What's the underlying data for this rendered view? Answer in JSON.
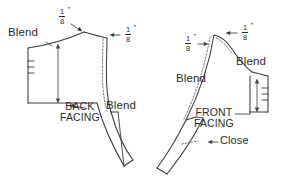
{
  "diagram": {
    "type": "sewing-pattern-adjustment",
    "background_color": "#ffffff",
    "ink_color": "#2b2b2b",
    "pieces": [
      {
        "id": "back-facing",
        "name_line1": "BACK",
        "name_line2": "FACING",
        "side": "left"
      },
      {
        "id": "front-facing",
        "name_line1": "FRONT",
        "name_line2": "FACING",
        "side": "right"
      }
    ],
    "labels": {
      "blend": "Blend",
      "close": "Close"
    },
    "measurements": {
      "eighth_numerator": "1",
      "eighth_denominator": "8",
      "inch_mark": "”"
    },
    "annotations": {
      "back_top_left_amount": "1/8”",
      "back_top_right_amount": "1/8”",
      "front_top_left_amount": "1/8”",
      "front_top_right_amount": "1/8”",
      "back_blend_left": "Blend",
      "back_blend_right": "Blend",
      "front_blend_left": "Blend",
      "front_blend_right": "Blend",
      "front_close": "Close"
    }
  }
}
